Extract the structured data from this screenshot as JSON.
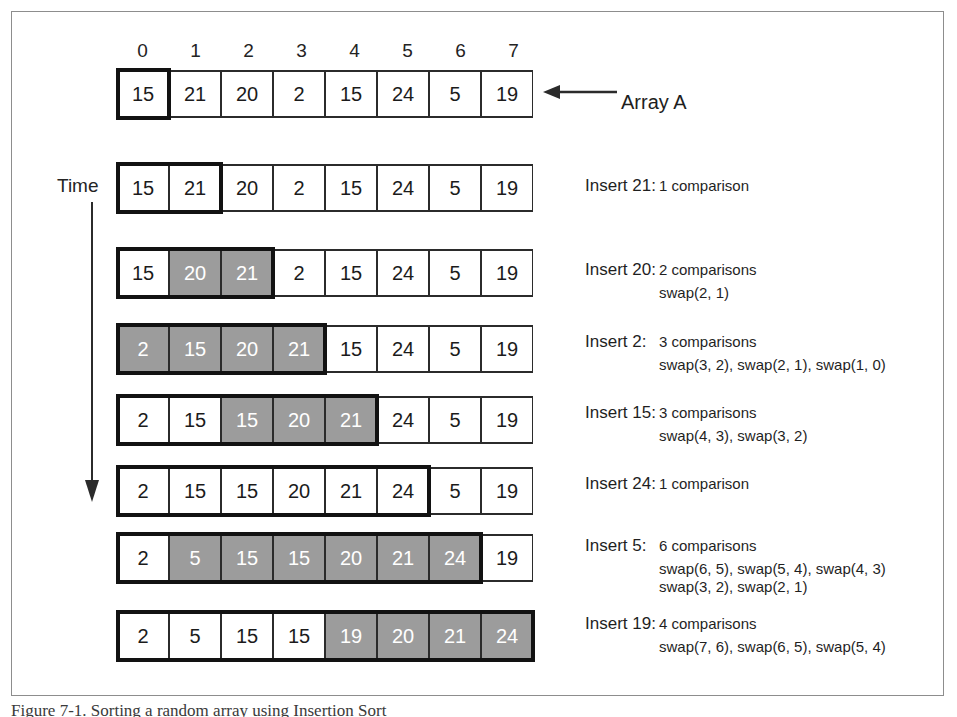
{
  "figure": {
    "caption": "Figure 7-1. Sorting a random array using Insertion Sort",
    "array_label": "Array A",
    "time_label": "Time",
    "indices": [
      "0",
      "1",
      "2",
      "3",
      "4",
      "5",
      "6",
      "7"
    ],
    "colors": {
      "shaded_cell": "#9c9c9c",
      "cell_border": "#2b2b2b",
      "sorted_outline": "#121212",
      "frame_border": "#8d8d8d",
      "text": "#1b1b1b",
      "shaded_text": "#ffffff"
    }
  },
  "rows": [
    {
      "name": "initial-array",
      "values": [
        "15",
        "21",
        "20",
        "2",
        "15",
        "24",
        "5",
        "19"
      ],
      "shaded": [
        false,
        false,
        false,
        false,
        false,
        false,
        false,
        false
      ],
      "sorted_count": 1
    },
    {
      "name": "insert-21",
      "values": [
        "15",
        "21",
        "20",
        "2",
        "15",
        "24",
        "5",
        "19"
      ],
      "shaded": [
        false,
        false,
        false,
        false,
        false,
        false,
        false,
        false
      ],
      "sorted_count": 2
    },
    {
      "name": "insert-20",
      "values": [
        "15",
        "20",
        "21",
        "2",
        "15",
        "24",
        "5",
        "19"
      ],
      "shaded": [
        false,
        true,
        true,
        false,
        false,
        false,
        false,
        false
      ],
      "sorted_count": 3
    },
    {
      "name": "insert-2",
      "values": [
        "2",
        "15",
        "20",
        "21",
        "15",
        "24",
        "5",
        "19"
      ],
      "shaded": [
        true,
        true,
        true,
        true,
        false,
        false,
        false,
        false
      ],
      "sorted_count": 4
    },
    {
      "name": "insert-15",
      "values": [
        "2",
        "15",
        "15",
        "20",
        "21",
        "24",
        "5",
        "19"
      ],
      "shaded": [
        false,
        false,
        true,
        true,
        true,
        false,
        false,
        false
      ],
      "sorted_count": 5
    },
    {
      "name": "insert-24",
      "values": [
        "2",
        "15",
        "15",
        "20",
        "21",
        "24",
        "5",
        "19"
      ],
      "shaded": [
        false,
        false,
        false,
        false,
        false,
        false,
        false,
        false
      ],
      "sorted_count": 6
    },
    {
      "name": "insert-5",
      "values": [
        "2",
        "5",
        "15",
        "15",
        "20",
        "21",
        "24",
        "19"
      ],
      "shaded": [
        false,
        true,
        true,
        true,
        true,
        true,
        true,
        false
      ],
      "sorted_count": 7
    },
    {
      "name": "insert-19",
      "values": [
        "2",
        "5",
        "15",
        "15",
        "19",
        "20",
        "21",
        "24"
      ],
      "shaded": [
        false,
        false,
        false,
        false,
        true,
        true,
        true,
        true
      ],
      "sorted_count": 8
    }
  ],
  "annotations": [
    {
      "name": "annotation-insert-21",
      "insert": "Insert 21:",
      "comparisons": "1 comparison",
      "swaps": "",
      "swaps2": ""
    },
    {
      "name": "annotation-insert-20",
      "insert": "Insert 20:",
      "comparisons": "2 comparisons",
      "swaps": "swap(2, 1)",
      "swaps2": ""
    },
    {
      "name": "annotation-insert-2",
      "insert": "Insert 2:",
      "comparisons": "3 comparisons",
      "swaps": "swap(3, 2), swap(2, 1), swap(1, 0)",
      "swaps2": ""
    },
    {
      "name": "annotation-insert-15",
      "insert": "Insert 15:",
      "comparisons": "3 comparisons",
      "swaps": "swap(4, 3), swap(3, 2)",
      "swaps2": ""
    },
    {
      "name": "annotation-insert-24",
      "insert": "Insert 24:",
      "comparisons": "1 comparison",
      "swaps": "",
      "swaps2": ""
    },
    {
      "name": "annotation-insert-5",
      "insert": "Insert 5:",
      "comparisons": "6 comparisons",
      "swaps": "swap(6, 5), swap(5, 4), swap(4, 3)",
      "swaps2": "swap(3, 2), swap(2, 1)"
    },
    {
      "name": "annotation-insert-19",
      "insert": "Insert 19:",
      "comparisons": "4 comparisons",
      "swaps": "swap(7, 6), swap(6, 5), swap(5, 4)",
      "swaps2": ""
    }
  ]
}
